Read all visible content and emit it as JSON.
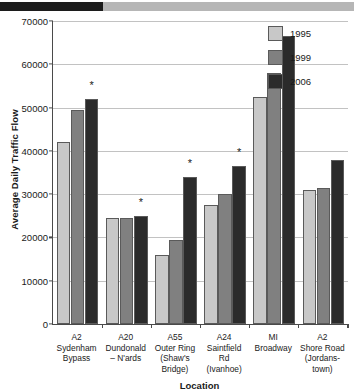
{
  "topbar": {
    "name": "progress-bar",
    "fill_color": "#1c1c1c",
    "track_color": "#b6b6b6",
    "fill_percent": 29
  },
  "legend": {
    "position": "top-right",
    "entries": [
      {
        "label": "1995",
        "color": "#c8c8c8"
      },
      {
        "label": "1999",
        "color": "#808080"
      },
      {
        "label": "2006",
        "color": "#2b2b2b"
      }
    ]
  },
  "chart_data": {
    "type": "bar",
    "title": "",
    "xlabel": "Location",
    "ylabel": "Average Daily Traffic Flow",
    "ylim": [
      0,
      70000
    ],
    "ytick_step": 10000,
    "yticks": [
      0,
      10000,
      20000,
      30000,
      40000,
      50000,
      60000,
      70000
    ],
    "ytick_labels": [
      "0",
      "10000",
      "20000",
      "30000",
      "40000",
      "50000",
      "60000",
      "70000"
    ],
    "grid": true,
    "grid_axis": "y",
    "legend_position": "top-right",
    "categories": [
      "A2 Sydenham Bypass",
      "A20 Dundonald – N'ards",
      "A55 Outer Ring (Shaw's Bridge)",
      "A24 Saintfield Rd (Ivanhoe)",
      "MI Broadway",
      "A2 Shore Road (Jordanstown)"
    ],
    "category_lines": [
      [
        "A2",
        "Sydenham",
        "Bypass"
      ],
      [
        "A20",
        "Dundonald",
        "– N'ards"
      ],
      [
        "A55",
        "Outer Ring",
        "(Shaw's",
        "Bridge)"
      ],
      [
        "A24",
        "Saintfield",
        "Rd",
        "(Ivanhoe)"
      ],
      [
        "MI",
        "Broadway"
      ],
      [
        "A2",
        "Shore Road",
        "(Jordans-",
        "town)"
      ]
    ],
    "series": [
      {
        "name": "1995",
        "color": "#c8c8c8",
        "values": [
          42000,
          24500,
          16000,
          27500,
          52500,
          31000
        ]
      },
      {
        "name": "1999",
        "color": "#808080",
        "values": [
          49500,
          24600,
          19500,
          30000,
          58000,
          31500
        ]
      },
      {
        "name": "2006",
        "color": "#2b2b2b",
        "values": [
          52000,
          25000,
          34000,
          36500,
          66500,
          38000
        ]
      }
    ],
    "annotations": [
      {
        "marker": "*",
        "category": "A2 Sydenham Bypass",
        "series": "2006"
      },
      {
        "marker": "*",
        "category": "A20 Dundonald – N'ards",
        "series": "2006"
      },
      {
        "marker": "*",
        "category": "A55 Outer Ring (Shaw's Bridge)",
        "series": "2006"
      },
      {
        "marker": "*",
        "category": "A24 Saintfield Rd (Ivanhoe)",
        "series": "2006"
      }
    ]
  }
}
